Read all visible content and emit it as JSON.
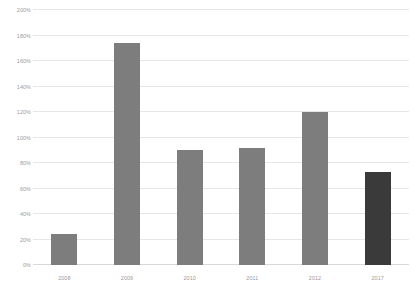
{
  "chart_data": {
    "type": "bar",
    "title": "",
    "xlabel": "",
    "ylabel": "",
    "categories": [
      "2008",
      "2009",
      "2010",
      "2011",
      "2012",
      "2017"
    ],
    "values": [
      24,
      174,
      90,
      92,
      120,
      73
    ],
    "value_labels": [
      "24%",
      "174%",
      "90%",
      "92%",
      "120%",
      "73%"
    ],
    "ylim": [
      0,
      200
    ],
    "ytick_step": 20,
    "ytick_labels": [
      "0%",
      "20%",
      "40%",
      "60%",
      "80%",
      "100%",
      "120%",
      "140%",
      "160%",
      "180%",
      "200%"
    ],
    "ytick_values": [
      0,
      20,
      40,
      60,
      80,
      100,
      120,
      140,
      160,
      180,
      200
    ],
    "grid": true,
    "legend": false,
    "bar_color": "#7d7d7d",
    "highlight_color": "#3a3a3a",
    "highlight_index": 5,
    "gridline_color": "#e6e6e6",
    "axis_text_color": "#9a9a9a",
    "background": "#ffffff"
  }
}
